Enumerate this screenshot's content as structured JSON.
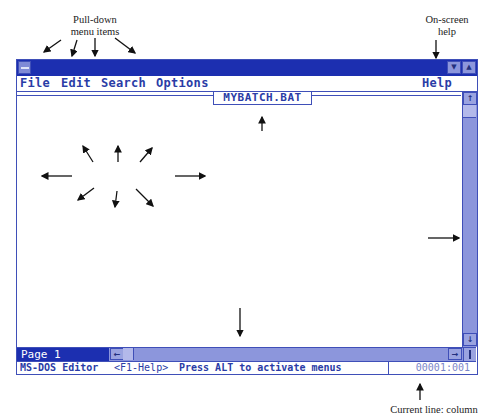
{
  "annotations": {
    "pulldown": [
      "Pull-down",
      "menu items"
    ],
    "onscreen_help": [
      "On-screen",
      "help"
    ],
    "file_being_edited": "File being edited",
    "editing_window": "EDITING WINDOW",
    "vertical_scroll": [
      "Vertical scroll",
      "bar"
    ],
    "horizontal_scroll": [
      "Horizontal",
      "scroll bar"
    ],
    "current_line": "Current line: column"
  },
  "window": {
    "titlebar": {
      "system_menu_icon": "dash-icon",
      "minimize_icon": "down-arrow-icon",
      "maximize_icon": "up-arrow-icon",
      "minimize_glyph": "▼",
      "maximize_glyph": "▲"
    },
    "menu": {
      "items": [
        "File",
        "Edit",
        "Search",
        "Options"
      ],
      "help": "Help"
    },
    "file_name": "MYBATCH.BAT",
    "scroll": {
      "up_glyph": "↑",
      "down_glyph": "↓",
      "left_glyph": "←",
      "right_glyph": "→"
    },
    "page_label": "Page 1",
    "status": {
      "app": "MS-DOS Editor",
      "help_hint": "<F1-Help>",
      "message": "Press ALT to activate menus",
      "position": "00001:001"
    }
  },
  "colors": {
    "title_blue": "#1c2fb0",
    "frame_blue": "#3f4fb8",
    "scroll_blue": "#8c96dc",
    "text_blue": "#2a3ca6"
  }
}
